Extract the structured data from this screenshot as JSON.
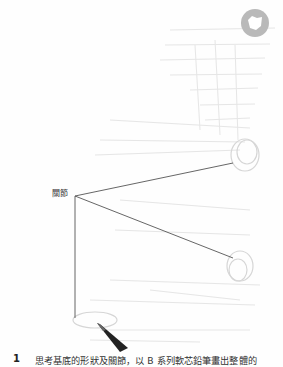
{
  "figure": {
    "label": "關節",
    "badge_icon": "chapter-circle-icon",
    "pencil_icon": "pencil-icon",
    "colors": {
      "line": "#555555",
      "badge": "#b9b9b9",
      "sketch": "#d8d8d8",
      "text": "#333333"
    },
    "lines": [
      {
        "from": [
          75,
          196
        ],
        "to": [
          233,
          163
        ]
      },
      {
        "from": [
          75,
          196
        ],
        "to": [
          233,
          258
        ]
      },
      {
        "from": [
          75,
          196
        ],
        "to": [
          75,
          318
        ]
      }
    ]
  },
  "caption": {
    "step_number": "1",
    "text": "思考基底的形狀及關節，以 B 系列軟芯鉛筆畫出整體的"
  }
}
